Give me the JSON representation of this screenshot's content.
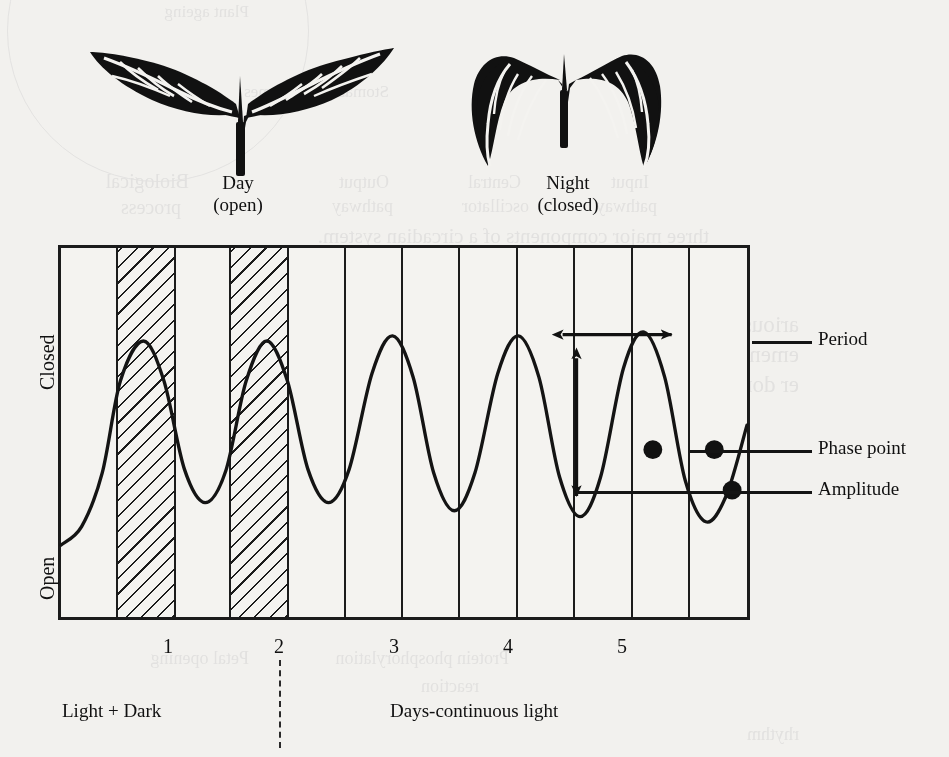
{
  "figure": {
    "plants": [
      {
        "name": "day-plant",
        "title": "Day",
        "state": "(open)"
      },
      {
        "name": "night-plant",
        "title": "Night",
        "state": "(closed)"
      }
    ],
    "callouts": [
      {
        "id": "period",
        "label": "Period"
      },
      {
        "id": "phase-point",
        "label": "Phase point"
      },
      {
        "id": "amplitude",
        "label": "Amplitude"
      }
    ],
    "axis_captions": {
      "light_dark": "Light + Dark",
      "continuous": "Days-continuous light"
    }
  },
  "chart_data": {
    "type": "line",
    "title": "",
    "xlabel": "Days",
    "ylabel": "Leaf position",
    "ytick_labels": [
      "Closed",
      "Open"
    ],
    "ylim": [
      0,
      1
    ],
    "xlim": [
      0,
      6
    ],
    "xtick_labels": [
      "1",
      "2",
      "3",
      "4",
      "5"
    ],
    "xticks": [
      1,
      2,
      3,
      4,
      5
    ],
    "grid": true,
    "grid_axis": "x",
    "legend": "none",
    "shaded_regions": [
      {
        "label": "dark",
        "x0": 0.5,
        "x1": 1.0,
        "pattern": "hatched"
      },
      {
        "label": "dark",
        "x0": 1.5,
        "x1": 2.0,
        "pattern": "hatched"
      }
    ],
    "series": [
      {
        "name": "leaf-movement-rhythm",
        "points": [
          {
            "x": 0.0,
            "y": 0.195
          },
          {
            "x": 0.18,
            "y": 0.245
          },
          {
            "x": 0.36,
            "y": 0.39
          },
          {
            "x": 0.52,
            "y": 0.64
          },
          {
            "x": 0.72,
            "y": 0.748
          },
          {
            "x": 0.9,
            "y": 0.64
          },
          {
            "x": 1.08,
            "y": 0.4
          },
          {
            "x": 1.26,
            "y": 0.31
          },
          {
            "x": 1.44,
            "y": 0.395
          },
          {
            "x": 1.62,
            "y": 0.64
          },
          {
            "x": 1.8,
            "y": 0.748
          },
          {
            "x": 1.98,
            "y": 0.64
          },
          {
            "x": 2.16,
            "y": 0.4
          },
          {
            "x": 2.34,
            "y": 0.31
          },
          {
            "x": 2.52,
            "y": 0.4
          },
          {
            "x": 2.72,
            "y": 0.66
          },
          {
            "x": 2.9,
            "y": 0.762
          },
          {
            "x": 3.08,
            "y": 0.65
          },
          {
            "x": 3.26,
            "y": 0.39
          },
          {
            "x": 3.44,
            "y": 0.288
          },
          {
            "x": 3.62,
            "y": 0.39
          },
          {
            "x": 3.82,
            "y": 0.66
          },
          {
            "x": 4.0,
            "y": 0.762
          },
          {
            "x": 4.18,
            "y": 0.65
          },
          {
            "x": 4.36,
            "y": 0.38
          },
          {
            "x": 4.54,
            "y": 0.272
          },
          {
            "x": 4.72,
            "y": 0.38
          },
          {
            "x": 4.92,
            "y": 0.675
          },
          {
            "x": 5.1,
            "y": 0.772
          },
          {
            "x": 5.28,
            "y": 0.65
          },
          {
            "x": 5.46,
            "y": 0.37
          },
          {
            "x": 5.64,
            "y": 0.258
          },
          {
            "x": 5.82,
            "y": 0.33
          },
          {
            "x": 6.0,
            "y": 0.52
          }
        ]
      }
    ],
    "annotations": [
      {
        "id": "period",
        "kind": "double-arrow-horizontal",
        "from_x": 4.32,
        "to_x": 5.3,
        "y": 0.78
      },
      {
        "id": "amplitude",
        "kind": "double-arrow-vertical",
        "x": 4.48,
        "from_y": 0.735,
        "to_y": 0.352
      },
      {
        "id": "phase-point",
        "kind": "markers",
        "marker": "filled-circle",
        "points": [
          {
            "x": 5.17,
            "y": 0.455
          },
          {
            "x": 5.7,
            "y": 0.455
          },
          {
            "x": 5.86,
            "y": 0.345
          }
        ]
      }
    ]
  },
  "bleed_through": {
    "lines": [
      "Plant ageing",
      "Stomatal opening",
      "Biological",
      "process",
      "Output",
      "pathway",
      "Central",
      "oscillator",
      "Input",
      "pathway",
      "Cryptochromes",
      "three major components of a circadian system.",
      "arious plant processes regulated by circadian rhythms include",
      "ement, stomatal opening and elongation growth, induction",
      "er dormancy, tuberisation and gene expression (Figure 1.2).",
      "Phytochromes",
      "Consideration",
      "levels",
      "Petal opening",
      "Protein phosphorylation",
      "reaction",
      "rhythm"
    ]
  }
}
